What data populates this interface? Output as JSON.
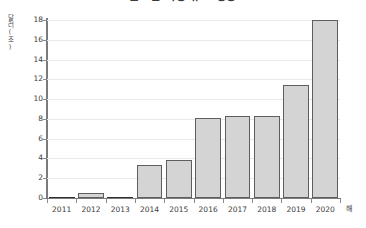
{
  "chart_data": {
    "type": "bar",
    "title": "글로벌 시장 규모 성장",
    "xlabel": "해",
    "ylabel": "달러(조)",
    "categories": [
      "2011",
      "2012",
      "2013",
      "2014",
      "2015",
      "2016",
      "2017",
      "2018",
      "2019",
      "2020"
    ],
    "values": [
      0.1,
      0.5,
      0.1,
      3.3,
      3.8,
      8.1,
      8.3,
      8.3,
      11.4,
      18.0
    ],
    "ylim": [
      0,
      18
    ],
    "yticks": [
      0,
      2,
      4,
      6,
      8,
      10,
      12,
      14,
      16,
      18
    ],
    "ytick_labels": [
      "0",
      "2",
      "4",
      "6",
      "8",
      "10",
      "12",
      "14",
      "16",
      "18"
    ],
    "grid": true,
    "legend": false,
    "series": [
      {
        "name": "값",
        "values": [
          0.1,
          0.5,
          0.1,
          3.3,
          3.8,
          8.1,
          8.3,
          8.3,
          11.4,
          18.0
        ]
      }
    ],
    "colors": {
      "bar_fill": "#d4d4d4",
      "bar_border": "#5e5e5e",
      "grid": "#e9e9e9",
      "axis": "#7b7b7b",
      "text": "#3c3c3c",
      "background": "#ffffff"
    }
  }
}
